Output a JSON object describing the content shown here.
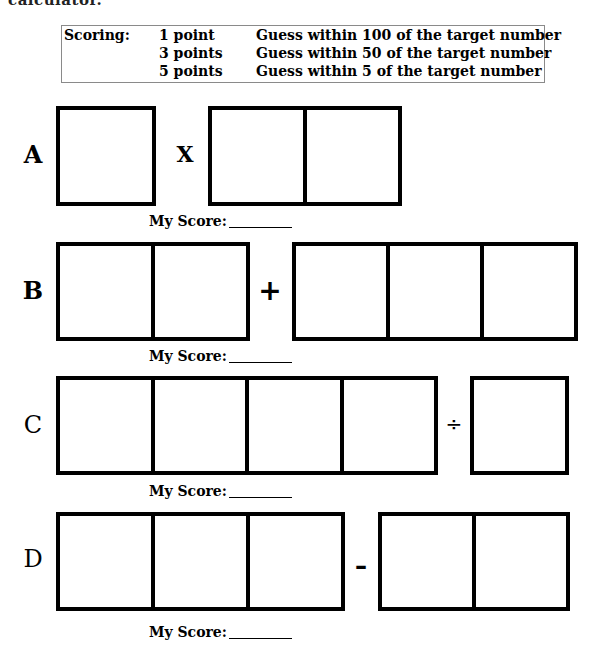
{
  "header": {
    "cutoff_text": "calculator."
  },
  "scoring": {
    "label": "Scoring:",
    "rows": [
      {
        "points": "1 point",
        "description": "Guess within 100 of the target number"
      },
      {
        "points": "3 points",
        "description": "Guess within 50 of the target number"
      },
      {
        "points": "5 points",
        "description": "Guess within 5 of the target number"
      }
    ]
  },
  "problems": [
    {
      "letter": "A",
      "operator": "X",
      "left_digits": 1,
      "right_digits": 2,
      "score_label": "My Score:",
      "score_value": ""
    },
    {
      "letter": "B",
      "operator": "+",
      "left_digits": 2,
      "right_digits": 3,
      "score_label": "My Score:",
      "score_value": ""
    },
    {
      "letter": "C",
      "operator": "÷",
      "left_digits": 4,
      "right_digits": 1,
      "score_label": "My Score:",
      "score_value": ""
    },
    {
      "letter": "D",
      "operator": "–",
      "left_digits": 3,
      "right_digits": 2,
      "score_label": "My Score:",
      "score_value": ""
    }
  ],
  "colors": {
    "ink": "#000000",
    "scoring_border": "#8a8a8a",
    "background": "#ffffff"
  }
}
